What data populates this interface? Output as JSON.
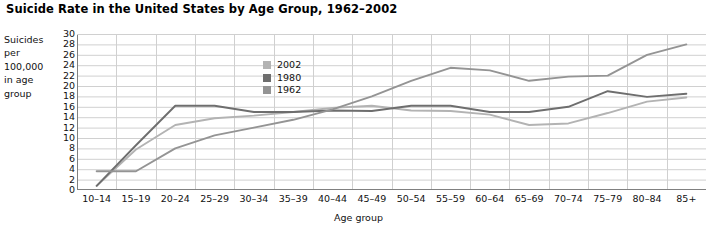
{
  "chart_data": {
    "type": "line",
    "title": "Suicide Rate in the United States by Age Group, 1962–2002",
    "xlabel": "Age group",
    "ylabel": "Suicides per 100,000 in age group",
    "ylabel_lines": [
      "Suicides",
      "per",
      "100,000",
      "in age",
      "group"
    ],
    "categories": [
      "10–14",
      "15–19",
      "20–24",
      "25–29",
      "30–34",
      "35–39",
      "40–44",
      "45–49",
      "50–54",
      "55–59",
      "60–64",
      "65–69",
      "70–74",
      "75–79",
      "80–84",
      "85+"
    ],
    "ylim": [
      0,
      30
    ],
    "yticks": [
      0,
      2,
      4,
      6,
      8,
      10,
      12,
      14,
      16,
      18,
      20,
      22,
      24,
      26,
      28,
      30
    ],
    "grid": true,
    "legend_position": "inside-upper-center",
    "series": [
      {
        "name": "2002",
        "color": "#b3b3b3",
        "values": [
          0.8,
          7.8,
          12.5,
          13.8,
          14.3,
          15.0,
          15.8,
          16.2,
          15.3,
          15.2,
          14.5,
          12.5,
          12.8,
          14.8,
          17.0,
          17.8
        ]
      },
      {
        "name": "1980",
        "color": "#6e6e6e",
        "values": [
          0.8,
          8.6,
          16.2,
          16.2,
          15.0,
          15.0,
          15.3,
          15.2,
          16.2,
          16.2,
          15.0,
          15.0,
          16.0,
          19.0,
          17.9,
          18.5
        ]
      },
      {
        "name": "1962",
        "color": "#949494",
        "values": [
          3.6,
          3.6,
          8.0,
          10.5,
          12.0,
          13.5,
          15.5,
          18.0,
          21.0,
          23.5,
          23.0,
          21.0,
          21.8,
          22.0,
          26.0,
          28.0
        ]
      }
    ],
    "note_last_point_1962": 26.0
  },
  "legend": {
    "entries": [
      {
        "label": "2002",
        "color": "#b3b3b3"
      },
      {
        "label": "1980",
        "color": "#6e6e6e"
      },
      {
        "label": "1962",
        "color": "#949494"
      }
    ]
  },
  "colors": {
    "background": "#ffffff",
    "grid": "#d0d0d0",
    "axis": "#808080",
    "text": "#111111"
  }
}
